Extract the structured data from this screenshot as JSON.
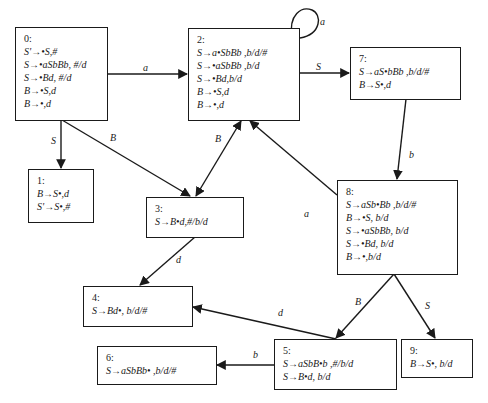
{
  "diagram": {
    "type": "LR(1) item-set automaton",
    "states": [
      {
        "id": "0",
        "label": "0:",
        "items": [
          "S'→•S,#",
          "S→•aSbBb, #/d",
          "S→•Bd, #/d",
          "B→•S,d",
          "B→•,d"
        ]
      },
      {
        "id": "1",
        "label": "1:",
        "items": [
          "B→S•,d",
          "S'→S•,#"
        ]
      },
      {
        "id": "2",
        "label": "2:",
        "items": [
          "S→a•SbBb ,b/d/#",
          "S→•aSbBb ,b/d",
          "S→•Bd,b/d",
          "B→•S,d",
          "B→•,d"
        ]
      },
      {
        "id": "3",
        "label": "3:",
        "items": [
          "S→B•d,#/b/d"
        ]
      },
      {
        "id": "4",
        "label": "4:",
        "items": [
          "S→Bd•, b/d/#"
        ]
      },
      {
        "id": "5",
        "label": "5:",
        "items": [
          "S→aSbB•b ,#/b/d",
          "S→B•d, b/d"
        ]
      },
      {
        "id": "6",
        "label": "6:",
        "items": [
          "S→aSbBb• ,b/d/#"
        ]
      },
      {
        "id": "7",
        "label": "7:",
        "items": [
          "S→aS•bBb ,b/d/#",
          "B→S•,d"
        ]
      },
      {
        "id": "8",
        "label": "8:",
        "items": [
          "S→aSb•Bb ,b/d/#",
          "B→•S, b/d",
          "S→•aSbBb, b/d",
          "S→•Bd, b/d",
          "B→•,b/d"
        ]
      },
      {
        "id": "9",
        "label": "9:",
        "items": [
          "B→S•, b/d"
        ]
      }
    ],
    "transitions": [
      {
        "from": "0",
        "to": "2",
        "symbol": "a"
      },
      {
        "from": "0",
        "to": "1",
        "symbol": "S"
      },
      {
        "from": "0",
        "to": "3",
        "symbol": "B"
      },
      {
        "from": "2",
        "to": "2",
        "symbol": "a"
      },
      {
        "from": "2",
        "to": "7",
        "symbol": "S"
      },
      {
        "from": "2",
        "to": "3",
        "symbol": "B"
      },
      {
        "from": "7",
        "to": "8",
        "symbol": "b"
      },
      {
        "from": "8",
        "to": "2",
        "symbol": "a"
      },
      {
        "from": "8",
        "to": "5",
        "symbol": "B"
      },
      {
        "from": "8",
        "to": "9",
        "symbol": "S"
      },
      {
        "from": "3",
        "to": "4",
        "symbol": "d"
      },
      {
        "from": "5",
        "to": "4",
        "symbol": "d"
      },
      {
        "from": "5",
        "to": "6",
        "symbol": "b"
      }
    ]
  },
  "colors": {
    "stroke": "#1a1a1a",
    "background": "#ffffff"
  }
}
